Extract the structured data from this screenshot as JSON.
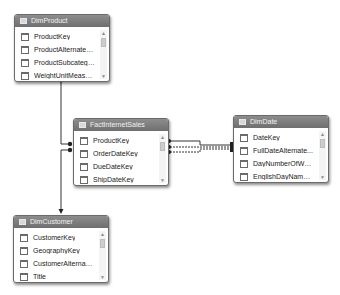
{
  "diagram": {
    "type": "data-model-diagram-view",
    "colors": {
      "header_bg": "#7a7a7a",
      "header_text": "#f2f2f2",
      "border": "#6b6b6b",
      "connector": "#333333",
      "background": "#ffffff"
    },
    "tables": [
      {
        "name": "DimProduct",
        "fields": [
          "ProductKey",
          "ProductAlternateKey",
          "ProductSubcategor...",
          "WeightUnitMeasur...",
          "SizeUnitMeasureC..."
        ]
      },
      {
        "name": "FactInternetSales",
        "fields": [
          "ProductKey",
          "OrderDateKey",
          "DueDateKey",
          "ShipDateKey",
          "CustomerKey"
        ]
      },
      {
        "name": "DimDate",
        "fields": [
          "DateKey",
          "FullDateAlternate...",
          "DayNumberOfWeek",
          "EnglishDayNameO...",
          "EnglishDayName..."
        ]
      },
      {
        "name": "DimCustomer",
        "fields": [
          "CustomerKey",
          "GeographyKey",
          "CustomerAlternate...",
          "Title",
          "FirstName"
        ]
      }
    ],
    "relationships": [
      {
        "from": "FactInternetSales",
        "to": "DimProduct",
        "style": "solid"
      },
      {
        "from": "FactInternetSales",
        "to": "DimCustomer",
        "style": "solid"
      },
      {
        "from": "FactInternetSales",
        "to": "DimDate",
        "style": "solid"
      },
      {
        "from": "FactInternetSales",
        "to": "DimDate",
        "style": "dashed"
      },
      {
        "from": "FactInternetSales",
        "to": "DimDate",
        "style": "dashed"
      }
    ]
  }
}
